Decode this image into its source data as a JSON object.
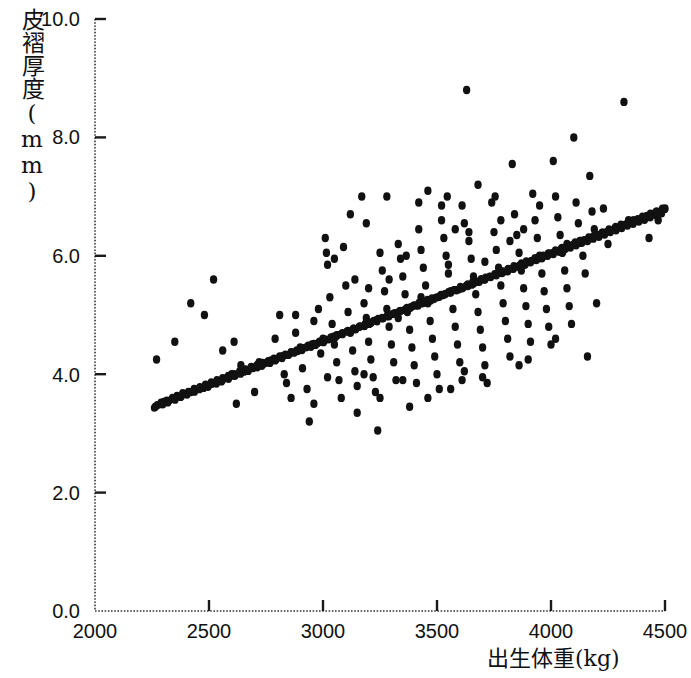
{
  "chart_data": {
    "type": "scatter",
    "title": "",
    "xlabel": "出生体重(kg)",
    "ylabel": "皮褶厚度(mm)",
    "xlim": [
      2000,
      4500
    ],
    "ylim": [
      0.0,
      10.0
    ],
    "xticks": [
      2000,
      2500,
      3000,
      3500,
      4000,
      4500
    ],
    "xtick_labels": [
      "2000",
      "2500",
      "3000",
      "3500",
      "4000",
      "4500"
    ],
    "yticks": [
      0.0,
      2.0,
      4.0,
      6.0,
      8.0,
      10.0
    ],
    "ytick_labels": [
      "0.0",
      "2.0",
      "4.0",
      "6.0",
      "8.0",
      "10.0"
    ],
    "grid": false,
    "axis_line_style": "dotted",
    "tick_direction": "in",
    "marker": {
      "shape": "circle",
      "color": "#111111",
      "size": 8
    },
    "regression_line": {
      "style": "thick-dotted-dense",
      "color": "#111111",
      "x_start": 2260,
      "y_start": 3.45,
      "x_end": 4500,
      "y_end": 6.8,
      "slope_per_kg": 0.001496,
      "intercept": 0.069
    },
    "points": [
      [
        2265,
        3.45
      ],
      [
        2290,
        3.52
      ],
      [
        2315,
        3.55
      ],
      [
        2340,
        3.6
      ],
      [
        2360,
        3.63
      ],
      [
        2385,
        3.68
      ],
      [
        2410,
        3.7
      ],
      [
        2435,
        3.75
      ],
      [
        2460,
        3.78
      ],
      [
        2485,
        3.82
      ],
      [
        2510,
        3.86
      ],
      [
        2535,
        3.9
      ],
      [
        2560,
        3.93
      ],
      [
        2585,
        3.97
      ],
      [
        2610,
        4.0
      ],
      [
        2635,
        4.05
      ],
      [
        2660,
        4.08
      ],
      [
        2685,
        4.12
      ],
      [
        2710,
        4.15
      ],
      [
        2735,
        4.19
      ],
      [
        2760,
        4.22
      ],
      [
        2785,
        4.26
      ],
      [
        2810,
        4.3
      ],
      [
        2835,
        4.33
      ],
      [
        2860,
        4.37
      ],
      [
        2885,
        4.4
      ],
      [
        2910,
        4.44
      ],
      [
        2935,
        4.48
      ],
      [
        2960,
        4.51
      ],
      [
        2985,
        4.55
      ],
      [
        3010,
        4.58
      ],
      [
        3035,
        4.62
      ],
      [
        3060,
        4.66
      ],
      [
        3085,
        4.69
      ],
      [
        3110,
        4.73
      ],
      [
        3135,
        4.77
      ],
      [
        3160,
        4.8
      ],
      [
        3185,
        4.84
      ],
      [
        3210,
        4.87
      ],
      [
        3235,
        4.91
      ],
      [
        3260,
        4.95
      ],
      [
        3285,
        4.98
      ],
      [
        3310,
        5.02
      ],
      [
        3335,
        5.06
      ],
      [
        3360,
        5.09
      ],
      [
        3385,
        5.13
      ],
      [
        3410,
        5.16
      ],
      [
        3435,
        5.2
      ],
      [
        3460,
        5.24
      ],
      [
        3485,
        5.27
      ],
      [
        3510,
        5.31
      ],
      [
        3535,
        5.35
      ],
      [
        3560,
        5.38
      ],
      [
        3585,
        5.42
      ],
      [
        3610,
        5.45
      ],
      [
        3635,
        5.49
      ],
      [
        3660,
        5.53
      ],
      [
        3685,
        5.56
      ],
      [
        3710,
        5.6
      ],
      [
        3735,
        5.64
      ],
      [
        3760,
        5.67
      ],
      [
        3785,
        5.71
      ],
      [
        3810,
        5.74
      ],
      [
        3835,
        5.78
      ],
      [
        3860,
        5.82
      ],
      [
        3885,
        5.85
      ],
      [
        3910,
        5.89
      ],
      [
        3935,
        5.93
      ],
      [
        3960,
        5.96
      ],
      [
        3985,
        6.0
      ],
      [
        4010,
        6.03
      ],
      [
        4035,
        6.07
      ],
      [
        4060,
        6.11
      ],
      [
        4085,
        6.14
      ],
      [
        4110,
        6.18
      ],
      [
        4135,
        6.22
      ],
      [
        4160,
        6.25
      ],
      [
        4185,
        6.29
      ],
      [
        4210,
        6.32
      ],
      [
        4235,
        6.36
      ],
      [
        4260,
        6.4
      ],
      [
        4285,
        6.43
      ],
      [
        4310,
        6.47
      ],
      [
        4335,
        6.51
      ],
      [
        4360,
        6.54
      ],
      [
        4385,
        6.58
      ],
      [
        4410,
        6.61
      ],
      [
        4435,
        6.65
      ],
      [
        4460,
        6.69
      ],
      [
        4485,
        6.72
      ],
      [
        4500,
        6.8
      ],
      [
        2270,
        4.25
      ],
      [
        2350,
        4.55
      ],
      [
        2420,
        5.2
      ],
      [
        2480,
        5.0
      ],
      [
        2520,
        5.6
      ],
      [
        2560,
        4.4
      ],
      [
        2600,
        4.0
      ],
      [
        2610,
        4.55
      ],
      [
        2620,
        3.5
      ],
      [
        2640,
        4.15
      ],
      [
        2700,
        3.7
      ],
      [
        2720,
        4.2
      ],
      [
        2790,
        4.6
      ],
      [
        2810,
        5.0
      ],
      [
        2820,
        4.3
      ],
      [
        2830,
        4.0
      ],
      [
        2840,
        3.85
      ],
      [
        2860,
        3.6
      ],
      [
        2880,
        4.7
      ],
      [
        2900,
        4.45
      ],
      [
        2910,
        4.1
      ],
      [
        2930,
        3.75
      ],
      [
        2940,
        3.2
      ],
      [
        2960,
        4.9
      ],
      [
        2980,
        5.1
      ],
      [
        2990,
        4.35
      ],
      [
        3000,
        4.6
      ],
      [
        3010,
        6.3
      ],
      [
        3015,
        6.05
      ],
      [
        3020,
        5.85
      ],
      [
        3030,
        5.3
      ],
      [
        3040,
        4.85
      ],
      [
        3050,
        4.5
      ],
      [
        3060,
        4.2
      ],
      [
        3070,
        3.9
      ],
      [
        3080,
        3.6
      ],
      [
        3100,
        5.5
      ],
      [
        3110,
        5.05
      ],
      [
        3120,
        4.7
      ],
      [
        3130,
        4.4
      ],
      [
        3140,
        4.05
      ],
      [
        3150,
        3.8
      ],
      [
        3170,
        7.0
      ],
      [
        3180,
        5.2
      ],
      [
        3190,
        4.95
      ],
      [
        3200,
        4.55
      ],
      [
        3210,
        4.25
      ],
      [
        3220,
        3.95
      ],
      [
        3230,
        3.7
      ],
      [
        3240,
        3.05
      ],
      [
        3250,
        6.05
      ],
      [
        3260,
        5.75
      ],
      [
        3270,
        5.4
      ],
      [
        3280,
        5.1
      ],
      [
        3290,
        4.8
      ],
      [
        3300,
        4.5
      ],
      [
        3310,
        4.2
      ],
      [
        3320,
        3.9
      ],
      [
        3330,
        6.2
      ],
      [
        3340,
        5.95
      ],
      [
        3350,
        5.65
      ],
      [
        3360,
        5.35
      ],
      [
        3365,
        6.0
      ],
      [
        3370,
        5.05
      ],
      [
        3380,
        4.75
      ],
      [
        3390,
        4.45
      ],
      [
        3400,
        4.15
      ],
      [
        3410,
        3.85
      ],
      [
        3420,
        6.45
      ],
      [
        3430,
        6.1
      ],
      [
        3440,
        5.8
      ],
      [
        3450,
        5.5
      ],
      [
        3460,
        5.2
      ],
      [
        3470,
        4.9
      ],
      [
        3480,
        4.6
      ],
      [
        3490,
        4.3
      ],
      [
        3500,
        4.0
      ],
      [
        3510,
        3.75
      ],
      [
        3520,
        6.6
      ],
      [
        3530,
        6.3
      ],
      [
        3540,
        6.0
      ],
      [
        3545,
        7.0
      ],
      [
        3550,
        5.7
      ],
      [
        3560,
        5.4
      ],
      [
        3570,
        5.1
      ],
      [
        3580,
        4.8
      ],
      [
        3590,
        4.5
      ],
      [
        3600,
        4.2
      ],
      [
        3610,
        3.9
      ],
      [
        3620,
        6.55
      ],
      [
        3630,
        8.8
      ],
      [
        3640,
        6.25
      ],
      [
        3650,
        5.95
      ],
      [
        3660,
        5.65
      ],
      [
        3670,
        5.35
      ],
      [
        3680,
        5.05
      ],
      [
        3690,
        4.75
      ],
      [
        3700,
        4.45
      ],
      [
        3710,
        4.15
      ],
      [
        3720,
        3.85
      ],
      [
        3740,
        6.9
      ],
      [
        3750,
        6.4
      ],
      [
        3760,
        6.1
      ],
      [
        3770,
        5.8
      ],
      [
        3780,
        5.5
      ],
      [
        3790,
        5.2
      ],
      [
        3800,
        4.9
      ],
      [
        3810,
        4.6
      ],
      [
        3820,
        4.3
      ],
      [
        3830,
        7.55
      ],
      [
        3840,
        6.7
      ],
      [
        3850,
        6.35
      ],
      [
        3860,
        6.05
      ],
      [
        3870,
        5.75
      ],
      [
        3880,
        5.45
      ],
      [
        3890,
        5.15
      ],
      [
        3900,
        4.85
      ],
      [
        3910,
        4.55
      ],
      [
        3920,
        7.05
      ],
      [
        3930,
        6.6
      ],
      [
        3940,
        6.3
      ],
      [
        3950,
        6.0
      ],
      [
        3960,
        5.7
      ],
      [
        3970,
        5.4
      ],
      [
        3980,
        5.1
      ],
      [
        3990,
        4.8
      ],
      [
        4000,
        4.5
      ],
      [
        4010,
        7.6
      ],
      [
        4020,
        7.0
      ],
      [
        4030,
        6.65
      ],
      [
        4040,
        6.35
      ],
      [
        4050,
        6.05
      ],
      [
        4060,
        5.75
      ],
      [
        4070,
        5.45
      ],
      [
        4080,
        5.15
      ],
      [
        4090,
        4.85
      ],
      [
        4100,
        8.0
      ],
      [
        4110,
        6.9
      ],
      [
        4120,
        6.55
      ],
      [
        4130,
        6.25
      ],
      [
        4140,
        6.0
      ],
      [
        4150,
        5.7
      ],
      [
        4160,
        4.3
      ],
      [
        4170,
        7.35
      ],
      [
        4180,
        6.75
      ],
      [
        4190,
        6.45
      ],
      [
        4200,
        5.2
      ],
      [
        4230,
        6.8
      ],
      [
        4250,
        6.2
      ],
      [
        4320,
        8.6
      ],
      [
        4340,
        6.6
      ],
      [
        4430,
        6.3
      ],
      [
        4470,
        6.6
      ],
      [
        3050,
        5.95
      ],
      [
        3090,
        6.15
      ],
      [
        3190,
        6.55
      ],
      [
        3280,
        7.0
      ],
      [
        3460,
        7.1
      ],
      [
        3520,
        6.85
      ],
      [
        3680,
        7.2
      ],
      [
        3755,
        7.0
      ],
      [
        3610,
        6.85
      ],
      [
        3420,
        6.9
      ],
      [
        2880,
        5.0
      ],
      [
        2960,
        3.5
      ],
      [
        3150,
        3.35
      ],
      [
        3350,
        3.9
      ],
      [
        3250,
        3.6
      ],
      [
        3700,
        3.95
      ],
      [
        3560,
        3.75
      ],
      [
        3860,
        4.15
      ],
      [
        3380,
        3.45
      ],
      [
        3460,
        3.6
      ],
      [
        3620,
        4.05
      ],
      [
        3900,
        4.25
      ],
      [
        4020,
        4.6
      ],
      [
        3180,
        4.0
      ],
      [
        3020,
        3.95
      ],
      [
        3120,
        6.7
      ],
      [
        3640,
        6.4
      ],
      [
        3820,
        6.25
      ],
      [
        3950,
        6.85
      ],
      [
        4070,
        6.2
      ],
      [
        3290,
        5.6
      ],
      [
        3330,
        4.95
      ],
      [
        3430,
        5.3
      ],
      [
        3550,
        5.85
      ],
      [
        3710,
        5.9
      ],
      [
        3140,
        5.6
      ],
      [
        3200,
        5.45
      ],
      [
        3580,
        6.45
      ],
      [
        3780,
        6.6
      ],
      [
        3880,
        6.45
      ]
    ]
  }
}
